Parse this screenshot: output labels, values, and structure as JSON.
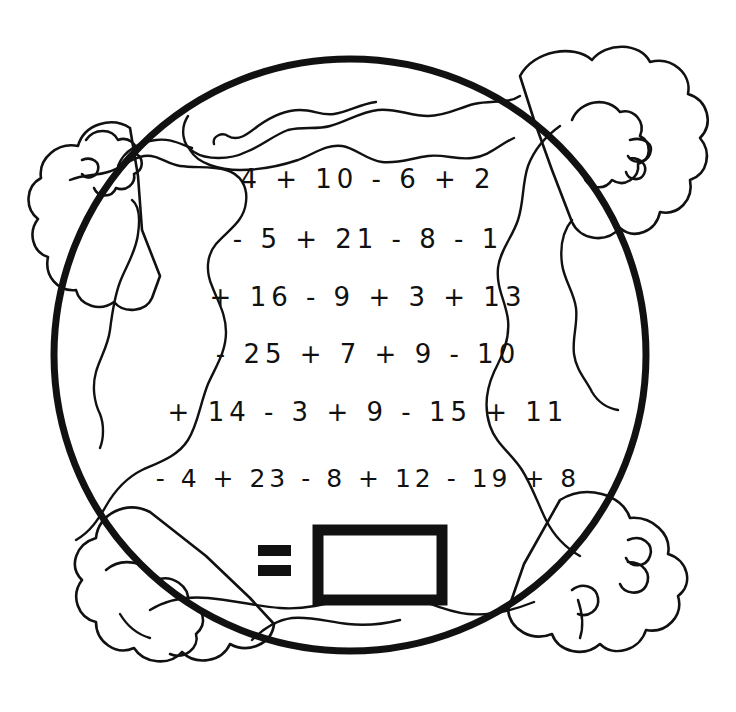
{
  "worksheet": {
    "title": "Earth globe addition and subtraction coloring worksheet",
    "theme": "earth-globe-with-clouds",
    "ink_color": "#111111",
    "background_color": "#ffffff"
  },
  "equation": {
    "rows": [
      {
        "id": "row-1",
        "text": "4 + 10 - 6 + 2"
      },
      {
        "id": "row-2",
        "text": "- 5 + 21 - 8 - 1"
      },
      {
        "id": "row-3",
        "text": "+ 16 - 9 + 3 + 13"
      },
      {
        "id": "row-4",
        "text": "- 25 + 7 + 9 - 10"
      },
      {
        "id": "row-5",
        "text": "+ 14 - 3 + 9 - 15 + 11"
      },
      {
        "id": "row-6",
        "text": "- 4 + 23 - 8 + 12 - 19 + 8"
      }
    ],
    "equals_sign": "=",
    "answer_box_value": ""
  },
  "shapes": {
    "globe": {
      "name": "globe-circle",
      "center_x": 350,
      "center_y": 355,
      "radius": 296,
      "stroke_width": 7
    },
    "clouds": [
      {
        "name": "cloud-top-left"
      },
      {
        "name": "cloud-top-right"
      },
      {
        "name": "cloud-bottom-left"
      },
      {
        "name": "cloud-bottom-right"
      }
    ],
    "continents": [
      {
        "name": "continent-north"
      },
      {
        "name": "continent-west"
      },
      {
        "name": "continent-east"
      },
      {
        "name": "continent-south"
      }
    ]
  }
}
